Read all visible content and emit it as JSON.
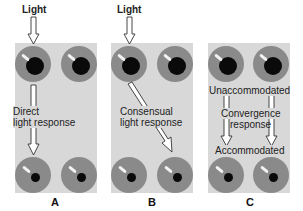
{
  "figure": {
    "panels": [
      {
        "id": "A",
        "label": "A",
        "light_label": "Light",
        "response_line1": "Direct",
        "response_line2": "light response"
      },
      {
        "id": "B",
        "label": "B",
        "light_label": "Light",
        "response_line1": "Consensual",
        "response_line2": "light response"
      },
      {
        "id": "C",
        "label": "C",
        "top_label": "Unaccommodated",
        "response_line1": "Convergence",
        "response_line2": "response",
        "bottom_label": "Accommodated"
      }
    ],
    "colors": {
      "panel_bg": "#d8d8d8",
      "iris": "#8a8a8a",
      "pupil": "#0a0a0a",
      "arrow": "#333333"
    }
  }
}
